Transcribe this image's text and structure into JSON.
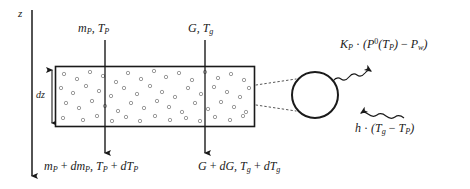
{
  "diagram": {
    "background_color": "#ffffff",
    "ink_color": "#1a1a1a",
    "particle_color": "#8a8a8a"
  },
  "axis": {
    "name": "vertical-axis",
    "label": "z",
    "direction": "down",
    "x": 32,
    "y_start": 10,
    "y_end": 178
  },
  "height_marker": {
    "name": "dz-extent",
    "label": "dz",
    "x": 52,
    "y_top": 66,
    "y_bottom": 127
  },
  "control_volume": {
    "name": "control-volume-box",
    "x": 55,
    "y": 66,
    "width": 200,
    "height": 61,
    "border_color": "#1a1a1a",
    "fill_color": "#ffffff",
    "particle_count": 56
  },
  "inflows": [
    {
      "name": "particle-inflow",
      "label_html": "m<sub>P</sub>, T<sub>P</sub>",
      "label_text": "m_P, T_P",
      "arrow_x": 105,
      "y_start": 40,
      "y_end": 66
    },
    {
      "name": "gas-inflow",
      "label_html": "G, T<sub>g</sub>",
      "label_text": "G, T_g",
      "arrow_x": 205,
      "y_start": 40,
      "y_end": 66
    }
  ],
  "outflows": [
    {
      "name": "particle-outflow",
      "label_html": "m<sub>P</sub> <span class=\"up\">+</span> dm<sub>P</sub>, T<sub>P</sub> <span class=\"up\">+</span> dT<sub>P</sub>",
      "label_text": "m_P + dm_P, T_P + dT_P",
      "arrow_x": 105,
      "y_start": 127,
      "y_end": 155
    },
    {
      "name": "gas-outflow",
      "label_html": "G <span class=\"up\">+</span> dG, T<sub>g</sub> <span class=\"up\">+</span> dT<sub>g</sub>",
      "label_text": "G + dG, T_g + dT_g",
      "arrow_x": 205,
      "y_start": 127,
      "y_end": 155
    }
  ],
  "magnifier": {
    "name": "magnified-particle",
    "circle_center_x": 315,
    "circle_center_y": 95,
    "circle_radius": 23,
    "leader_from_x": 256,
    "leader_top_y": 85,
    "leader_bottom_y": 105
  },
  "transfer_terms": [
    {
      "name": "mass-transfer-term",
      "label_html": "K<sub>P</sub> <span class=\"up\">&middot;</span> (P<sup>0</sup>(T<sub>P</sub>) <span class=\"up\">&minus;</span> P<sub>w</sub>)",
      "label_text": "K_P · (P^0(T_P) − P_w)",
      "direction": "outward",
      "arrow_style": "wavy"
    },
    {
      "name": "heat-transfer-term",
      "label_html": "h <span class=\"up\">&middot;</span> (T<sub>g</sub> <span class=\"up\">&minus;</span> T<sub>P</sub>)",
      "label_text": "h · (T_g − T_P)",
      "direction": "inward",
      "arrow_style": "wavy"
    }
  ]
}
